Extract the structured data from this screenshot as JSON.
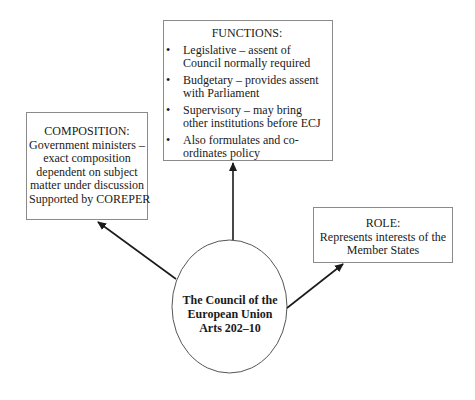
{
  "diagram": {
    "center": {
      "lines": [
        "The Council of the",
        "European Union",
        "Arts 202–10"
      ]
    },
    "functions": {
      "heading": "FUNCTIONS:",
      "items": [
        "Legislative – assent of Council normally required",
        "Budgetary – provides assent with Parliament",
        "Supervisory – may bring other institutions before ECJ",
        "Also formulates and co-ordinates policy"
      ],
      "bullet": "•"
    },
    "composition": {
      "lines": [
        "COMPOSITION:",
        "Government ministers –",
        "exact composition",
        "dependent on subject",
        "matter under discussion",
        "Supported by COREPER"
      ]
    },
    "role": {
      "lines": [
        "ROLE:",
        "Represents interests of the",
        "Member States"
      ]
    },
    "colors": {
      "box_border": "#8a8a8a",
      "arrow": "#1a1a1a",
      "ellipse_stroke": "#555555",
      "text": "#1a1a1a"
    }
  }
}
